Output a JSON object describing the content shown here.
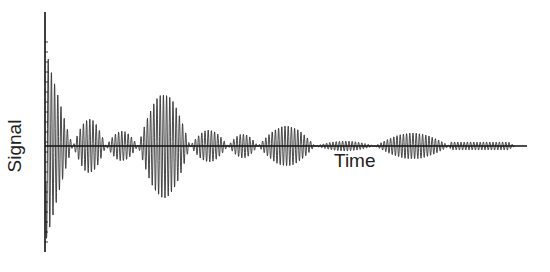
{
  "chart_data": {
    "type": "line",
    "title": "",
    "xlabel": "Time",
    "ylabel": "Signal",
    "grid": false,
    "legend": null,
    "axes": {
      "origin_px": [
        45,
        146
      ],
      "y_axis_top_px": 12,
      "y_axis_bottom_px": 252,
      "x_axis_end_px": 527
    },
    "carrier_period_px": 3.2,
    "envelope_lobes": [
      {
        "x_start": 45,
        "x_end": 73,
        "peak": 100,
        "decay": true
      },
      {
        "x_start": 73,
        "x_end": 106,
        "peak": 27
      },
      {
        "x_start": 106,
        "x_end": 138,
        "peak": 15
      },
      {
        "x_start": 138,
        "x_end": 190,
        "peak": 52
      },
      {
        "x_start": 190,
        "x_end": 228,
        "peak": 16
      },
      {
        "x_start": 228,
        "x_end": 258,
        "peak": 12
      },
      {
        "x_start": 258,
        "x_end": 315,
        "peak": 20
      },
      {
        "x_start": 315,
        "x_end": 375,
        "peak": 5
      },
      {
        "x_start": 375,
        "x_end": 450,
        "peak": 13
      },
      {
        "x_start": 450,
        "x_end": 515,
        "peak": 4,
        "flat": true
      }
    ],
    "colors": {
      "signal": "#333333",
      "axis": "#111111",
      "background": "#ffffff"
    }
  }
}
